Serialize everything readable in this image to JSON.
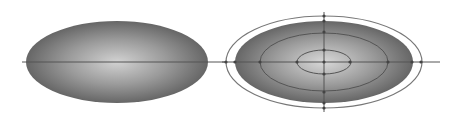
{
  "diagram": {
    "background": "#ffffff",
    "gradient": {
      "center_color": "#d2d2d2",
      "mid_color": "#9a9a9a",
      "edge_color": "#666666"
    },
    "line_color": "#555555",
    "left_figure": {
      "label": "",
      "ellipse": {
        "cx": 117,
        "cy": 62,
        "rx": 91,
        "ry": 41
      },
      "axis": {
        "x1": 22,
        "x2": 227,
        "y": 62
      }
    },
    "right_figure": {
      "label": "",
      "ellipse": {
        "cx": 324,
        "cy": 62,
        "rx": 89,
        "ry": 41
      },
      "outer_ring": {
        "rx": 98,
        "ry": 46,
        "color": "#777777"
      },
      "contours": [
        {
          "rx": 64,
          "ry": 29
        },
        {
          "rx": 27,
          "ry": 12
        }
      ],
      "h_axis": {
        "x1": 222,
        "x2": 440,
        "y": 62
      },
      "v_axis": {
        "x": 324,
        "y1": 12,
        "y2": 112
      },
      "tick_points": [
        [
          226,
          62
        ],
        [
          235,
          62
        ],
        [
          260,
          62
        ],
        [
          297,
          62
        ],
        [
          324,
          62
        ],
        [
          350,
          62
        ],
        [
          388,
          62
        ],
        [
          412,
          62
        ],
        [
          421,
          62
        ],
        [
          324,
          16
        ],
        [
          324,
          21
        ],
        [
          324,
          32
        ],
        [
          324,
          50
        ],
        [
          324,
          74
        ],
        [
          324,
          92
        ],
        [
          324,
          103
        ],
        [
          324,
          108
        ]
      ]
    }
  }
}
